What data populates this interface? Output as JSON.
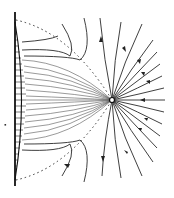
{
  "figure": {
    "elements": {
      "wall": "vertical wall with hatched velocity profile on left",
      "sink": "small open circle point sink on the right",
      "dividing_streamlines": "two dotted lines from wall ends converging toward sink",
      "streamlines": "solid lines with arrowheads converging into the sink",
      "marker": "small dot left of the wall"
    },
    "colors": {
      "ink": "#222222",
      "background": "#ffffff"
    }
  }
}
